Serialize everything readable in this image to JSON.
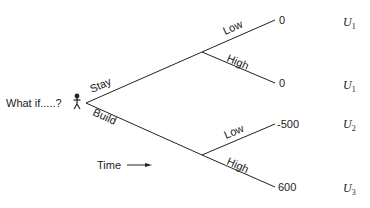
{
  "diagram": {
    "type": "decision-tree",
    "root": {
      "label": "What if.....?",
      "icon": "person-icon"
    },
    "time_label": "Time",
    "branches": [
      {
        "label": "Stay",
        "outcomes": [
          {
            "label": "Low",
            "value": "0",
            "utility": "U",
            "utility_sub": "1"
          },
          {
            "label": "High",
            "value": "0",
            "utility": "U",
            "utility_sub": "1"
          }
        ]
      },
      {
        "label": "Build",
        "outcomes": [
          {
            "label": "Low",
            "value": "-500",
            "utility": "U",
            "utility_sub": "2"
          },
          {
            "label": "High",
            "value": "600",
            "utility": "U",
            "utility_sub": "3"
          }
        ]
      }
    ]
  }
}
